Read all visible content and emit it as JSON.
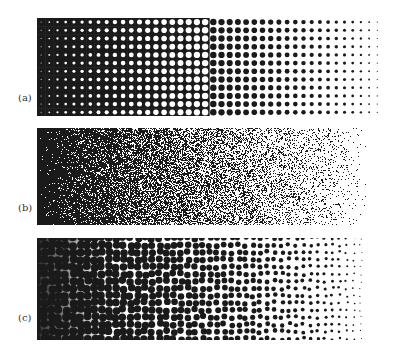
{
  "figure": {
    "panels": [
      {
        "id": "a",
        "label": "(a)",
        "type": "clustered-dot-grid",
        "top": 18,
        "height": 98,
        "label_top": 98
      },
      {
        "id": "b",
        "label": "(b)",
        "type": "dispersed-blue-noise",
        "top": 128,
        "height": 97,
        "label_top": 206
      },
      {
        "id": "c",
        "label": "(c)",
        "type": "voronoi-cells",
        "top": 238,
        "height": 102,
        "label_top": 316
      }
    ],
    "ink_color": "#1a1a1a",
    "paper_color": "#ffffff"
  }
}
